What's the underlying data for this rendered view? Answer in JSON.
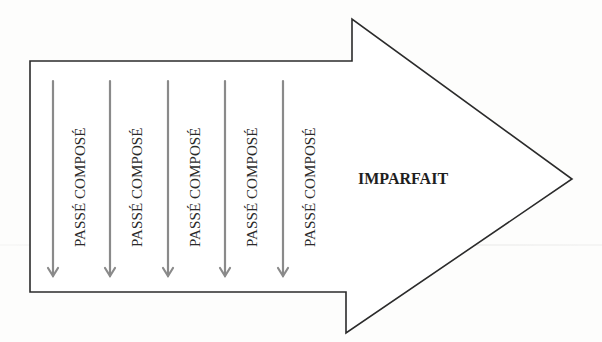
{
  "diagram": {
    "main_arrow": {
      "label": "IMPARFAIT",
      "stroke_color": "#2b2b2b",
      "fill_color": "#ffffff"
    },
    "sub_arrows": {
      "color": "#8a8a8a",
      "items": [
        {
          "label": "PASSÉ COMPOSÉ"
        },
        {
          "label": "PASSÉ COMPOSÉ"
        },
        {
          "label": "PASSÉ COMPOSÉ"
        },
        {
          "label": "PASSÉ COMPOSÉ"
        },
        {
          "label": "PASSÉ COMPOSÉ"
        }
      ]
    }
  }
}
